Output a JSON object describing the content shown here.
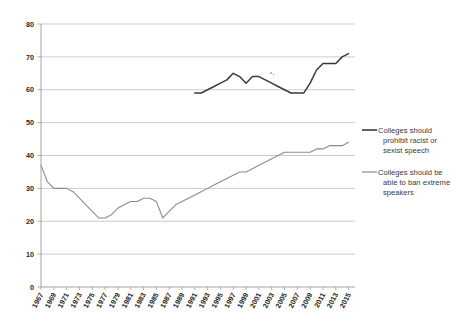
{
  "chart_data": {
    "type": "line",
    "title": "",
    "subtitle": "",
    "xlabel": "",
    "ylabel": "",
    "xlim": [
      1967,
      2016
    ],
    "ylim": [
      0,
      80
    ],
    "grid": true,
    "legend_position": "right",
    "y_ticks": [
      0,
      10,
      20,
      30,
      40,
      50,
      60,
      70,
      80
    ],
    "x_tick_labels": [
      "1967",
      "1969",
      "1971",
      "1973",
      "1975",
      "1977",
      "1979",
      "1981",
      "1983",
      "1985",
      "1987",
      "1989",
      "1991",
      "1993",
      "1995",
      "1997",
      "1999",
      "2001",
      "2003",
      "2005",
      "2007",
      "2009",
      "2011",
      "2013",
      "2015"
    ],
    "series": [
      {
        "name": "Colleges should prohibit racist or sexist speech",
        "color": "#3b3b3b",
        "x": [
          1991,
          1992,
          1993,
          1994,
          1995,
          1996,
          1997,
          1998,
          1999,
          2000,
          2001,
          2002,
          2003,
          2004,
          2005,
          2006,
          2007,
          2008,
          2009,
          2010,
          2011,
          2012,
          2013,
          2014,
          2015
        ],
        "values": [
          59,
          59,
          60,
          61,
          62,
          63,
          65,
          64,
          62,
          64,
          64,
          63,
          62,
          61,
          60,
          59,
          59,
          59,
          62,
          66,
          68,
          68,
          68,
          70,
          71
        ]
      },
      {
        "name": "Colleges should be able to ban extreme speakers",
        "color": "#8c8c8c",
        "x": [
          1967,
          1968,
          1969,
          1970,
          1971,
          1972,
          1973,
          1974,
          1975,
          1976,
          1977,
          1978,
          1979,
          1980,
          1981,
          1982,
          1983,
          1984,
          1985,
          1986,
          1987,
          1988,
          1989,
          1990,
          1991,
          1992,
          1993,
          1994,
          1995,
          1996,
          1997,
          1998,
          1999,
          2000,
          2001,
          2002,
          2003,
          2004,
          2005,
          2006,
          2007,
          2008,
          2009,
          2010,
          2011,
          2012,
          2013,
          2014,
          2015
        ],
        "values": [
          37,
          32,
          30,
          30,
          30,
          29,
          27,
          25,
          23,
          21,
          21,
          22,
          24,
          25,
          26,
          26,
          27,
          27,
          26,
          21,
          23,
          25,
          26,
          27,
          28,
          29,
          30,
          31,
          32,
          33,
          34,
          35,
          35,
          36,
          37,
          38,
          39,
          40,
          41,
          41,
          41,
          41,
          41,
          42,
          42,
          43,
          43,
          43,
          44
        ]
      }
    ]
  },
  "legend": {
    "entries": [
      {
        "lines": [
          "Colleges should",
          "prohibit racist or",
          "sexist speech"
        ]
      },
      {
        "lines": [
          "Colleges should be",
          "able to ban extreme",
          "speakers"
        ]
      }
    ]
  }
}
